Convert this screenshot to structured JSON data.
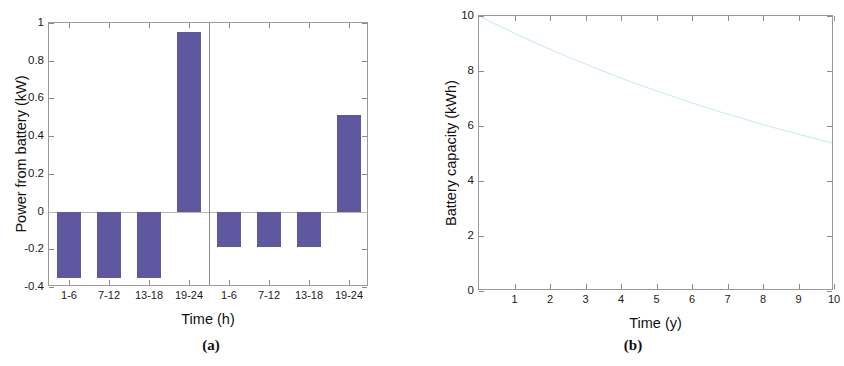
{
  "figure": {
    "panels": [
      {
        "caption": "(a)",
        "chart_data": {
          "type": "bar",
          "title": "",
          "xlabel": "Time (h)",
          "ylabel": "Power from battery (kW)",
          "categories": [
            "1-6",
            "7-12",
            "13-18",
            "19-24",
            "1-6",
            "7-12",
            "13-18",
            "19-24"
          ],
          "values": [
            -0.35,
            -0.35,
            -0.35,
            0.95,
            -0.19,
            -0.19,
            -0.19,
            0.51
          ],
          "ylim": [
            -0.4,
            1
          ],
          "ytick_labels": [
            "1",
            "0.8",
            "0.6",
            "0.4",
            "0.2",
            "0",
            "-0.2",
            "-0.4"
          ],
          "ytick_values": [
            1,
            0.8,
            0.6,
            0.4,
            0.2,
            0,
            -0.2,
            -0.4
          ],
          "grid": false,
          "legend": "none",
          "bar_color": "#5f57a0",
          "group_separator_after_index": 3,
          "groups": [
            "day 1",
            "day 2"
          ]
        }
      },
      {
        "caption": "(b)",
        "chart_data": {
          "type": "line",
          "title": "",
          "xlabel": "Time (y)",
          "ylabel": "Battery capacity (kWh)",
          "xlim": [
            0,
            10
          ],
          "ylim": [
            0,
            10
          ],
          "xtick_labels": [
            "1",
            "2",
            "3",
            "4",
            "5",
            "6",
            "7",
            "8",
            "9",
            "10"
          ],
          "xtick_values": [
            1,
            2,
            3,
            4,
            5,
            6,
            7,
            8,
            9,
            10
          ],
          "ytick_labels": [
            "0",
            "2",
            "4",
            "6",
            "8",
            "10"
          ],
          "ytick_values": [
            0,
            2,
            4,
            6,
            8,
            10
          ],
          "grid": false,
          "legend": "none",
          "line_color": "#d4ebee",
          "series": [
            {
              "name": "Battery capacity",
              "x": [
                0,
                0.5,
                1,
                1.5,
                2,
                2.5,
                3,
                3.5,
                4,
                4.5,
                5,
                5.5,
                6,
                6.5,
                7,
                7.5,
                8,
                8.5,
                9,
                9.5,
                10
              ],
              "y": [
                10.0,
                9.68,
                9.37,
                9.07,
                8.79,
                8.51,
                8.25,
                7.99,
                7.74,
                7.5,
                7.27,
                7.05,
                6.83,
                6.62,
                6.42,
                6.23,
                6.04,
                5.86,
                5.69,
                5.52,
                5.35
              ]
            }
          ]
        }
      }
    ]
  }
}
